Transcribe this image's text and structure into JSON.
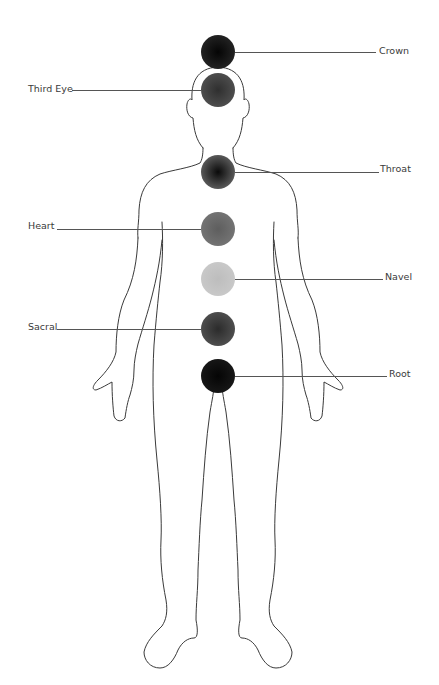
{
  "diagram": {
    "title": "",
    "chakras": [
      {
        "name": "Crown",
        "side": "right",
        "cx": 218,
        "cy": 52,
        "r": 17,
        "center": "#050505",
        "edge": "#2e2e2e",
        "label_x": 379,
        "label_y": 45,
        "line_from": 235,
        "line_to": 376,
        "line_y": 52
      },
      {
        "name": "Third Eye",
        "side": "left",
        "cx": 218,
        "cy": 90,
        "r": 17,
        "center": "#2f2f2f",
        "edge": "#5a5a5a",
        "label_x": 28,
        "label_y": 83,
        "line_from": 72,
        "line_to": 201,
        "line_y": 90
      },
      {
        "name": "Throat",
        "side": "right",
        "cx": 218,
        "cy": 172,
        "r": 17,
        "center": "#0a0a0a",
        "edge": "#7a7a7a",
        "label_x": 380,
        "label_y": 163,
        "line_from": 235,
        "line_to": 379,
        "line_y": 172
      },
      {
        "name": "Heart",
        "side": "left",
        "cx": 218,
        "cy": 229,
        "r": 17,
        "center": "#5e5e5e",
        "edge": "#7c7c7c",
        "label_x": 28,
        "label_y": 220,
        "line_from": 57,
        "line_to": 201,
        "line_y": 229
      },
      {
        "name": "Navel",
        "side": "right",
        "cx": 218,
        "cy": 279,
        "r": 17,
        "center": "#bdbdbd",
        "edge": "#cdcdcd",
        "label_x": 385,
        "label_y": 271,
        "line_from": 235,
        "line_to": 383,
        "line_y": 279
      },
      {
        "name": "Sacral",
        "side": "left",
        "cx": 218,
        "cy": 329,
        "r": 17,
        "center": "#2b2b2b",
        "edge": "#5c5c5c",
        "label_x": 28,
        "label_y": 321,
        "line_from": 57,
        "line_to": 201,
        "line_y": 329
      },
      {
        "name": "Root",
        "side": "right",
        "cx": 218,
        "cy": 376,
        "r": 17,
        "center": "#050505",
        "edge": "#1e1e1e",
        "label_x": 389,
        "label_y": 368,
        "line_from": 235,
        "line_to": 387,
        "line_y": 376
      }
    ],
    "colors": {
      "outline": "#3a3a3a",
      "leader_line": "#555555",
      "label_text": "#3a3a3a",
      "background": "#ffffff"
    }
  }
}
